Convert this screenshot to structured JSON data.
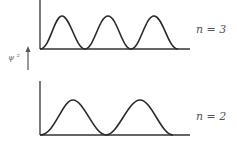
{
  "figure": {
    "y_axis_label": "ψ ²",
    "panels": [
      {
        "label": "n = 3",
        "n": 3,
        "peaks": 3
      },
      {
        "label": "n = 2",
        "n": 2,
        "peaks": 2
      }
    ]
  },
  "colors": {
    "line": "#2a2a2a",
    "text": "#555555"
  }
}
